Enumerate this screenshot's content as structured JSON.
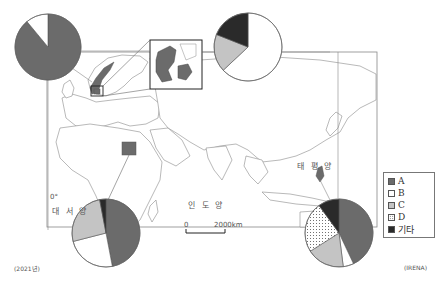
{
  "title": "",
  "year_note": "(2021년)",
  "source": "(IRENA)",
  "map": {
    "oceans": {
      "atlantic": "대 서 양",
      "indian": "인 도 양",
      "pacific": "태 평 양"
    },
    "meridian_label": "0°",
    "scale_bar": {
      "zero": "0",
      "end": "2000km"
    },
    "highlighted_countries": [
      "Norway",
      "Denmark",
      "Egypt",
      "Philippines"
    ]
  },
  "legend": {
    "items": [
      {
        "key": "A",
        "label": "A",
        "color": "#6b6b6b",
        "pattern": "solid"
      },
      {
        "key": "B",
        "label": "B",
        "color": "#ffffff",
        "pattern": "solid"
      },
      {
        "key": "C",
        "label": "C",
        "color": "#c4c4c4",
        "pattern": "solid"
      },
      {
        "key": "D",
        "label": "D",
        "color": "#ffffff",
        "pattern": "dotted"
      },
      {
        "key": "other",
        "label": "기타",
        "color": "#2a2a2a",
        "pattern": "solid"
      }
    ]
  },
  "chart_data": [
    {
      "type": "pie",
      "title": "Norway",
      "categories": [
        "A",
        "B",
        "C",
        "D",
        "기타"
      ],
      "values": [
        89,
        11,
        0,
        0,
        0
      ]
    },
    {
      "type": "pie",
      "title": "Denmark",
      "categories": [
        "A",
        "B",
        "C",
        "D",
        "기타"
      ],
      "values": [
        0,
        63,
        18,
        0,
        19
      ]
    },
    {
      "type": "pie",
      "title": "Egypt",
      "categories": [
        "A",
        "B",
        "C",
        "D",
        "기타"
      ],
      "values": [
        47,
        24,
        26,
        0,
        3
      ]
    },
    {
      "type": "pie",
      "title": "Philippines",
      "categories": [
        "A",
        "B",
        "C",
        "D",
        "기타"
      ],
      "values": [
        43,
        5,
        18,
        24,
        10
      ]
    }
  ]
}
